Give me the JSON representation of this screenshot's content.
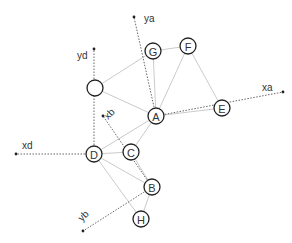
{
  "diagram": {
    "type": "graph-with-coordinate-frames",
    "nodes": [
      {
        "id": "unlabeled",
        "label": "",
        "x": 95,
        "y": 88
      },
      {
        "id": "G",
        "label": "G",
        "x": 153,
        "y": 51
      },
      {
        "id": "F",
        "label": "F",
        "x": 188,
        "y": 46
      },
      {
        "id": "A",
        "label": "A",
        "x": 156,
        "y": 116
      },
      {
        "id": "E",
        "label": "E",
        "x": 222,
        "y": 108
      },
      {
        "id": "D",
        "label": "D",
        "x": 94,
        "y": 154
      },
      {
        "id": "C",
        "label": "C",
        "x": 131,
        "y": 152
      },
      {
        "id": "B",
        "label": "B",
        "x": 152,
        "y": 187
      },
      {
        "id": "H",
        "label": "H",
        "x": 141,
        "y": 219
      }
    ],
    "edges": [
      [
        "unlabeled",
        "G"
      ],
      [
        "unlabeled",
        "A"
      ],
      [
        "G",
        "F"
      ],
      [
        "G",
        "A"
      ],
      [
        "F",
        "A"
      ],
      [
        "F",
        "E"
      ],
      [
        "A",
        "E"
      ],
      [
        "A",
        "D"
      ],
      [
        "A",
        "C"
      ],
      [
        "D",
        "C"
      ],
      [
        "D",
        "B"
      ],
      [
        "D",
        "H"
      ],
      [
        "C",
        "B"
      ],
      [
        "B",
        "H"
      ]
    ],
    "axes": [
      {
        "name": "ya",
        "label": "ya",
        "from": "A",
        "to_x": 134,
        "to_y": 17,
        "label_x": 144,
        "label_y": 22
      },
      {
        "name": "xa",
        "label": "xa",
        "from": "A",
        "to_x": 283,
        "to_y": 92,
        "label_x": 262,
        "label_y": 91
      },
      {
        "name": "yd",
        "label": "yd",
        "from": "D",
        "to_x": 94,
        "to_y": 49,
        "label_x": 77,
        "label_y": 59
      },
      {
        "name": "xd",
        "label": "xd",
        "from": "D",
        "to_x": 16,
        "to_y": 154,
        "label_x": 22,
        "label_y": 149
      },
      {
        "name": "xb",
        "label": "xb",
        "from": "B",
        "to_x": 103,
        "to_y": 116,
        "label_x": 108,
        "label_y": 120
      },
      {
        "name": "yb",
        "label": "yb",
        "from": "B",
        "to_x": 83,
        "to_y": 231,
        "label_x": 82,
        "label_y": 222
      }
    ]
  }
}
